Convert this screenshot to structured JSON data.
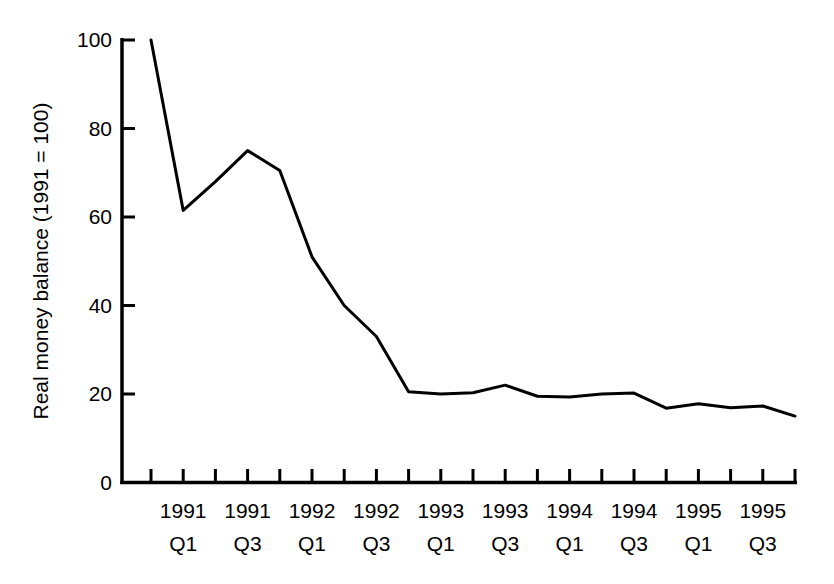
{
  "chart_data": {
    "type": "line",
    "title": "",
    "subtitle": "",
    "xlabel": "",
    "ylabel": "Real money balance (1991 = 100)",
    "ylim": [
      0,
      100
    ],
    "yticks": [
      0,
      20,
      40,
      60,
      80,
      100
    ],
    "ytick_labels": [
      "0",
      "20",
      "40",
      "60",
      "80",
      "100"
    ],
    "grid": false,
    "legend": false,
    "legend_position": "none",
    "line_color": "#000000",
    "line_width": 3,
    "x": [
      "1990 Q4",
      "1991 Q1",
      "1991 Q2",
      "1991 Q3",
      "1991 Q4",
      "1992 Q1",
      "1992 Q2",
      "1992 Q3",
      "1992 Q4",
      "1993 Q1",
      "1993 Q2",
      "1993 Q3",
      "1993 Q4",
      "1994 Q1",
      "1994 Q2",
      "1994 Q3",
      "1994 Q4",
      "1995 Q1",
      "1995 Q2",
      "1995 Q3",
      "1995 Q4"
    ],
    "xtick_labels": [
      {
        "year": "",
        "quarter": ""
      },
      {
        "year": "1991",
        "quarter": "Q1"
      },
      {
        "year": "",
        "quarter": ""
      },
      {
        "year": "1991",
        "quarter": "Q3"
      },
      {
        "year": "",
        "quarter": ""
      },
      {
        "year": "1992",
        "quarter": "Q1"
      },
      {
        "year": "",
        "quarter": ""
      },
      {
        "year": "1992",
        "quarter": "Q3"
      },
      {
        "year": "",
        "quarter": ""
      },
      {
        "year": "1993",
        "quarter": "Q1"
      },
      {
        "year": "",
        "quarter": ""
      },
      {
        "year": "1993",
        "quarter": "Q3"
      },
      {
        "year": "",
        "quarter": ""
      },
      {
        "year": "1994",
        "quarter": "Q1"
      },
      {
        "year": "",
        "quarter": ""
      },
      {
        "year": "1994",
        "quarter": "Q3"
      },
      {
        "year": "",
        "quarter": ""
      },
      {
        "year": "1995",
        "quarter": "Q1"
      },
      {
        "year": "",
        "quarter": ""
      },
      {
        "year": "1995",
        "quarter": "Q3"
      },
      {
        "year": "",
        "quarter": ""
      }
    ],
    "values": [
      100.0,
      61.5,
      68.0,
      75.0,
      70.5,
      51.0,
      40.0,
      33.0,
      20.5,
      20.0,
      20.3,
      22.0,
      19.5,
      19.3,
      20.0,
      20.2,
      16.8,
      17.8,
      16.9,
      17.3,
      15.0
    ]
  }
}
